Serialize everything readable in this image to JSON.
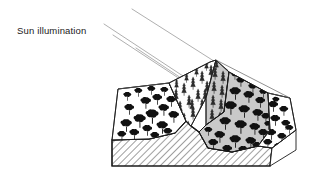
{
  "figure": {
    "type": "block-diagram",
    "background_color": "#ffffff"
  },
  "annotations": {
    "sun_label": "Sun illumination"
  },
  "colors": {
    "outline": "#1a1a1a",
    "ray": "#9a9a9a",
    "shadow_fill": "#c9c9c9",
    "shadow_fill_dark": "#b9b9b9",
    "sunlit_fill": "#ffffff",
    "panel_fill": "#fbfbfb",
    "hatch_line": "#2a2a2a",
    "tree_fill": "#111111",
    "conifer_fill": "#2b2b2b"
  },
  "sun_rays": {
    "count": 4,
    "direction": "upper-left to lower-right",
    "angle_deg": 28,
    "stroke_color": "#9a9a9a",
    "lines": [
      {
        "x1": 136,
        "y1": 48,
        "x2": 219,
        "y2": 103
      },
      {
        "x1": 113,
        "y1": 35,
        "x2": 214,
        "y2": 102
      },
      {
        "x1": 104,
        "y1": 24,
        "x2": 223,
        "y2": 103
      },
      {
        "x1": 133,
        "y1": 9,
        "x2": 227,
        "y2": 70
      }
    ]
  },
  "terrain": {
    "ridge_peak": {
      "x": 216,
      "y": 59
    },
    "regions": [
      {
        "name": "left-sunlit-slope",
        "fill": "#ffffff",
        "illumination": "sunlit",
        "vegetation": "deciduous",
        "tree_count": 19
      },
      {
        "name": "upper-conifer-terrace",
        "fill": "#fdfdfd",
        "illumination": "sunlit",
        "vegetation": "coniferous",
        "tree_count": 20
      },
      {
        "name": "ridge-shadow-face",
        "fill": "#c9c9c9",
        "illumination": "shadowed",
        "vegetation": "coniferous",
        "tree_count": 9
      },
      {
        "name": "right-shadow-slope",
        "fill": "#c9c9c9",
        "illumination": "shadowed",
        "vegetation": "deciduous",
        "tree_count": 24
      },
      {
        "name": "far-right-terrace",
        "fill": "#ffffff",
        "illumination": "sunlit",
        "vegetation": "sparse-deciduous",
        "tree_count": 10
      }
    ],
    "base_block": {
      "name": "geologic-substrate",
      "pattern": "diagonal-hatching",
      "hatch_angle_deg": 45,
      "hatch_spacing_px": 5
    }
  }
}
